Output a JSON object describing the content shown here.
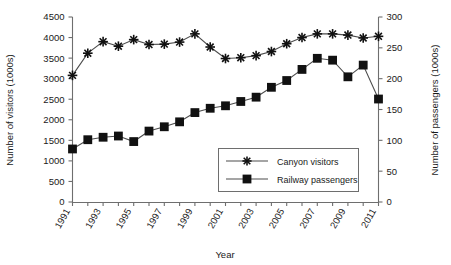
{
  "chart_data": {
    "type": "line",
    "title": "",
    "xlabel": "Year",
    "ylabel": "Number of visitors (1000s)",
    "y2label": "Number of passengers (1000s)",
    "x": [
      1991,
      1992,
      1993,
      1994,
      1995,
      1996,
      1997,
      1998,
      1999,
      2000,
      2001,
      2002,
      2003,
      2004,
      2005,
      2006,
      2007,
      2008,
      2009,
      2010,
      2011
    ],
    "xtick_labels": [
      "1991",
      "1993",
      "1995",
      "1997",
      "1999",
      "2001",
      "2003",
      "2005",
      "2007",
      "2009",
      "2011"
    ],
    "xlim": [
      1991,
      2011
    ],
    "grid": false,
    "legend_position": "center-right-inside",
    "series": [
      {
        "name": "Canyon visitors",
        "axis": "left",
        "marker": "star",
        "unit": "1000s",
        "ylim": [
          0,
          4500
        ],
        "ytick_labels": [
          "0",
          "500",
          "1000",
          "1500",
          "2000",
          "2500",
          "3000",
          "3500",
          "4000",
          "4500"
        ],
        "yticks": [
          0,
          500,
          1000,
          1500,
          2000,
          2500,
          3000,
          3500,
          4000,
          4500
        ],
        "values": [
          3080,
          3620,
          3900,
          3790,
          3950,
          3830,
          3840,
          3890,
          4090,
          3770,
          3490,
          3510,
          3560,
          3660,
          3850,
          4000,
          4090,
          4090,
          4060,
          3990,
          4030
        ]
      },
      {
        "name": "Railway passengers",
        "axis": "right",
        "marker": "square",
        "unit": "1000s",
        "ylim": [
          0,
          300
        ],
        "ytick_labels": [
          "0",
          "50",
          "100",
          "150",
          "200",
          "250",
          "300"
        ],
        "yticks": [
          0,
          50,
          100,
          150,
          200,
          250,
          300
        ],
        "values": [
          86,
          101,
          105,
          107,
          98,
          115,
          122,
          130,
          145,
          152,
          156,
          163,
          170,
          186,
          197,
          215,
          233,
          230,
          203,
          222,
          167
        ]
      }
    ]
  },
  "legend": {
    "entries": [
      {
        "label": "Canyon visitors",
        "marker": "star"
      },
      {
        "label": "Railway passengers",
        "marker": "square"
      }
    ]
  },
  "axes": {
    "left_title": "Number of visitors (1000s)",
    "right_title": "Number of passengers (1000s)",
    "bottom_title": "Year"
  }
}
